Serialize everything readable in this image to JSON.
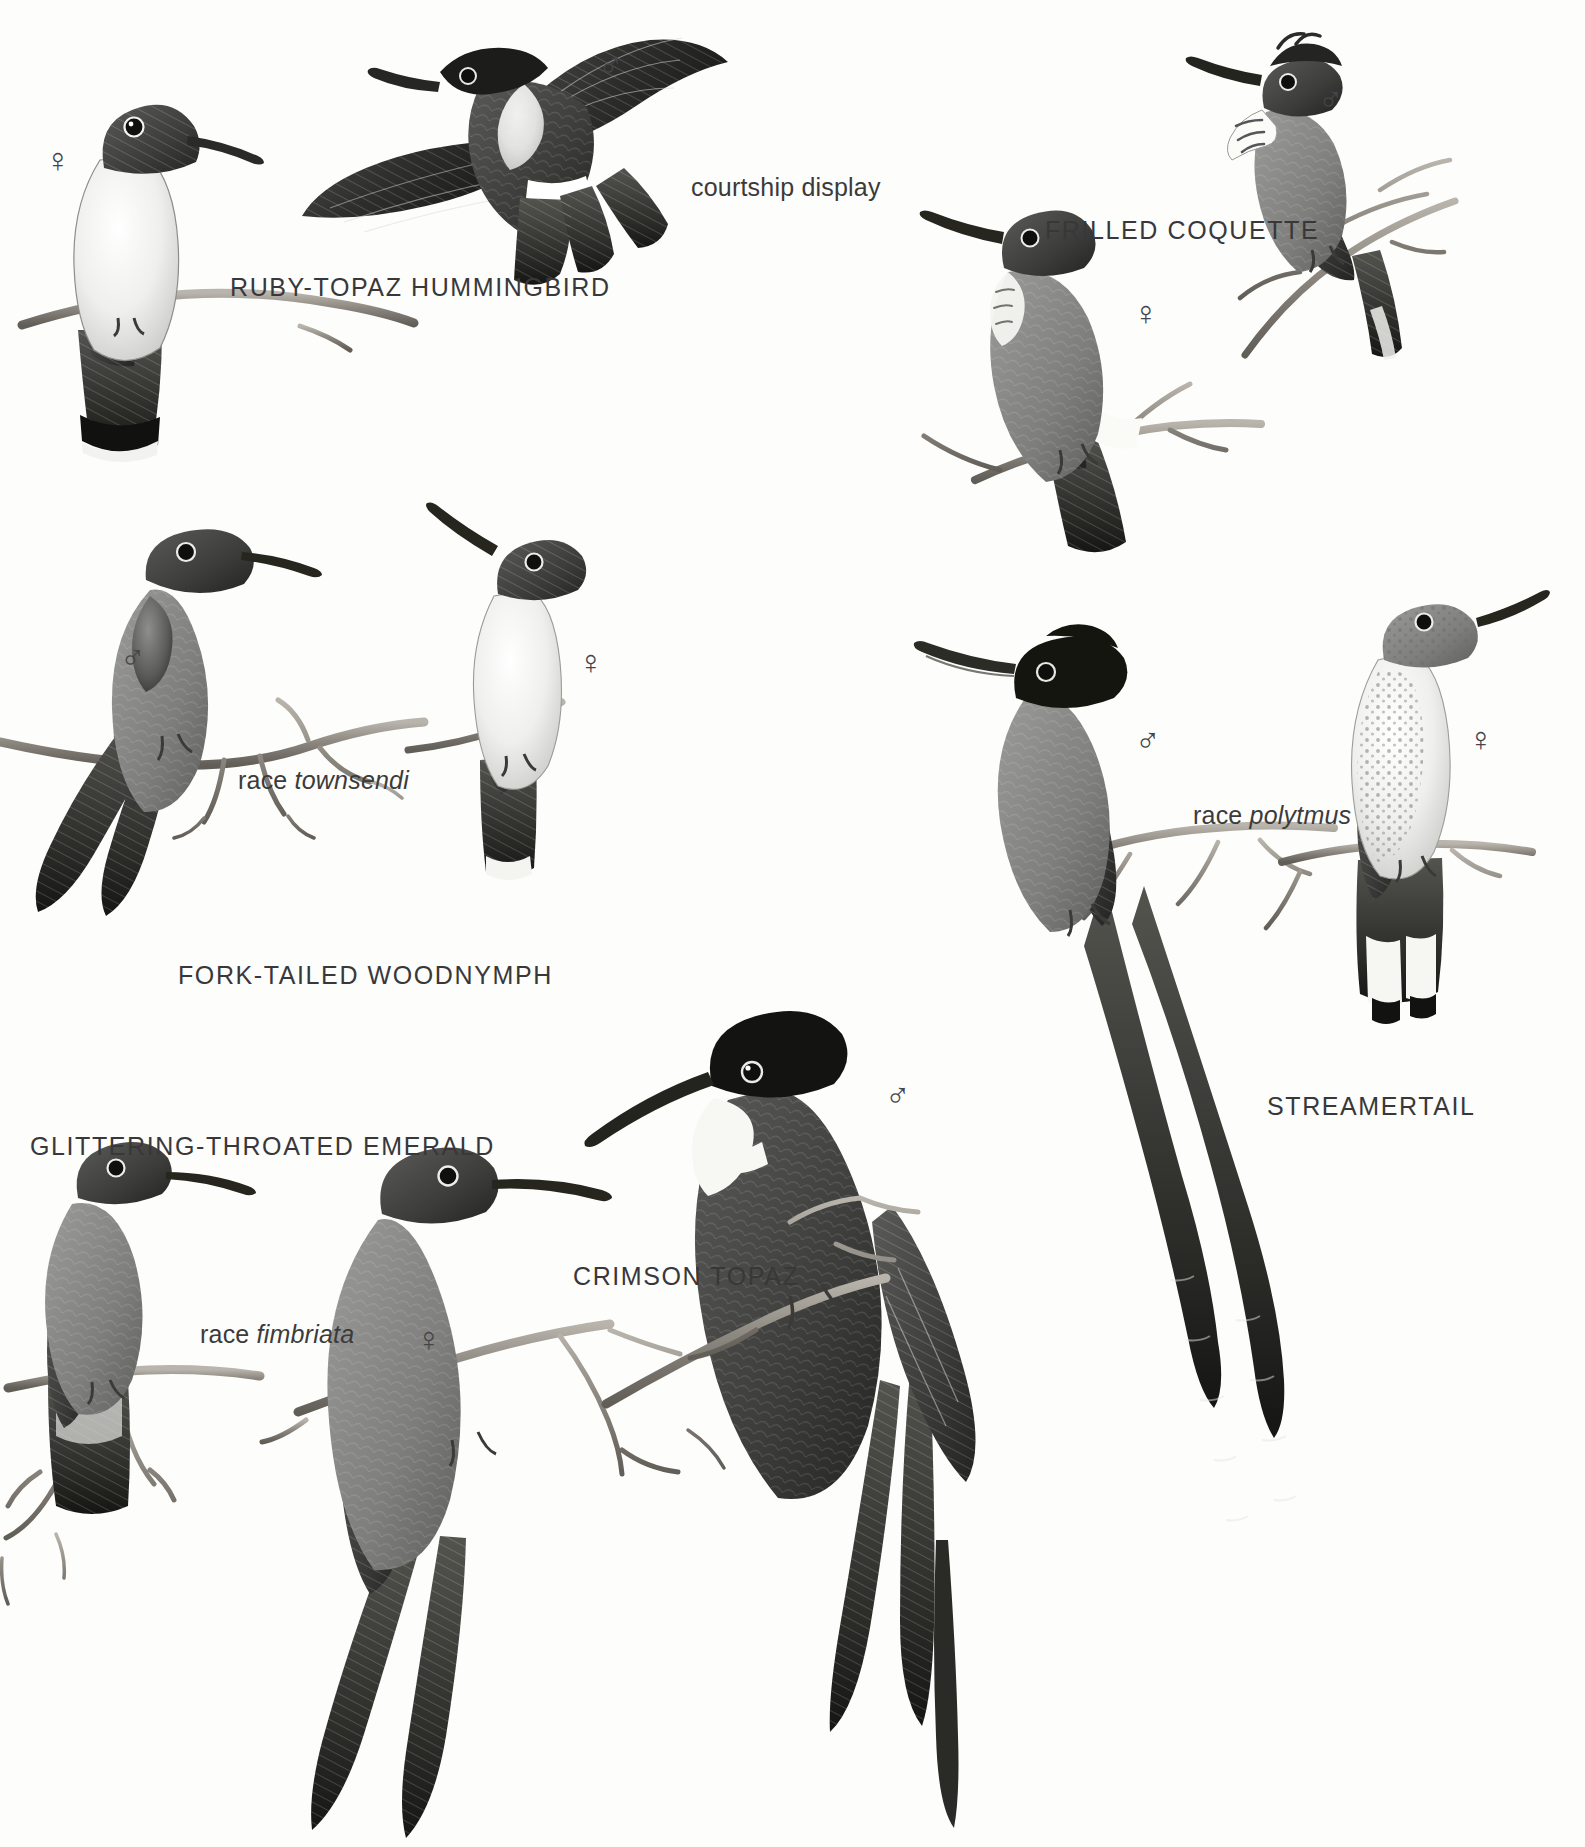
{
  "plate": {
    "title": "Hummingbirds plate",
    "background_color": "#fdfdfc",
    "ink_color": "#38383a"
  },
  "species": [
    {
      "id": "ruby-topaz-hummingbird",
      "name": "RUBY-TOPAZ HUMMINGBIRD",
      "x": 230,
      "y": 275,
      "figures": [
        {
          "sex": "♀",
          "sex_name": "female",
          "x": 45,
          "y": 143
        },
        {
          "sex": "♂",
          "sex_name": "male",
          "x": 598,
          "y": 48
        }
      ],
      "annotations": [
        {
          "text": "courtship display",
          "x": 691,
          "y": 175
        }
      ]
    },
    {
      "id": "frilled-coquette",
      "name": "FRILLED COQUETTE",
      "x": 1045,
      "y": 218,
      "figures": [
        {
          "sex": "♂",
          "sex_name": "male",
          "x": 1318,
          "y": 82
        },
        {
          "sex": "♀",
          "sex_name": "female",
          "x": 1133,
          "y": 296
        }
      ],
      "annotations": []
    },
    {
      "id": "fork-tailed-woodnymph",
      "name": "FORK-TAILED WOODNYMPH",
      "x": 178,
      "y": 963,
      "figures": [
        {
          "sex": "♂",
          "sex_name": "male",
          "x": 120,
          "y": 640
        },
        {
          "sex": "♀",
          "sex_name": "female",
          "x": 578,
          "y": 645
        }
      ],
      "annotations": [
        {
          "text_roman": "race ",
          "text_italic": "townsendi",
          "x": 238,
          "y": 768
        }
      ]
    },
    {
      "id": "streamertail",
      "name": "STREAMERTAIL",
      "x": 1267,
      "y": 1094,
      "figures": [
        {
          "sex": "♂",
          "sex_name": "male",
          "x": 1135,
          "y": 723
        },
        {
          "sex": "♀",
          "sex_name": "female",
          "x": 1468,
          "y": 722
        }
      ],
      "annotations": [
        {
          "text_roman": "race ",
          "text_italic": "polytmus",
          "x": 1193,
          "y": 803
        }
      ]
    },
    {
      "id": "glittering-throated-emerald",
      "name": "GLITTERING-THROATED EMERALD",
      "x": 30,
      "y": 1134,
      "figures": [],
      "annotations": [
        {
          "text_roman": "race ",
          "text_italic": "fimbriata",
          "x": 200,
          "y": 1322
        }
      ]
    },
    {
      "id": "crimson-topaz",
      "name": "CRIMSON TOPAZ",
      "x": 573,
      "y": 1264,
      "figures": [
        {
          "sex": "♂",
          "sex_name": "male",
          "x": 885,
          "y": 1078
        },
        {
          "sex": "♀",
          "sex_name": "female",
          "x": 416,
          "y": 1322
        }
      ],
      "annotations": []
    }
  ],
  "labels_flat": [
    "RUBY-TOPAZ HUMMINGBIRD",
    "courtship display",
    "FRILLED COQUETTE",
    "FORK-TAILED WOODNYMPH",
    "race townsendi",
    "STREAMERTAIL",
    "race polytmus",
    "GLITTERING-THROATED EMERALD",
    "race fimbriata",
    "CRIMSON TOPAZ"
  ],
  "symbols": {
    "male": "♂",
    "female": "♀"
  }
}
